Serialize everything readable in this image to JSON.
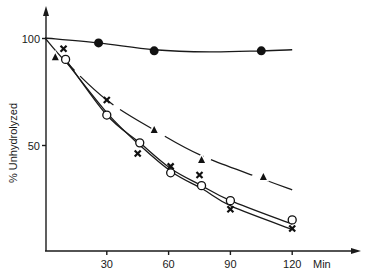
{
  "chart_data": {
    "type": "line",
    "title": "",
    "xlabel": "Min",
    "ylabel": "% Unhydrolyzed",
    "xlim": [
      0,
      140
    ],
    "ylim": [
      0,
      110
    ],
    "x_ticks": [
      30,
      60,
      90,
      120
    ],
    "y_ticks": [
      50,
      100
    ],
    "grid": false,
    "legend": "none",
    "series": [
      {
        "name": "filled-circle",
        "marker": "filled-circle",
        "line": "solid",
        "points": [
          [
            26,
            97.7
          ],
          [
            53,
            94
          ],
          [
            105,
            94
          ]
        ],
        "curve": [
          [
            0,
            100
          ],
          [
            26,
            97.7
          ],
          [
            53,
            94.5
          ],
          [
            80,
            93.5
          ],
          [
            105,
            94
          ],
          [
            120,
            94.5
          ]
        ]
      },
      {
        "name": "triangle",
        "marker": "filled-triangle",
        "line": "dashed-gaps",
        "points": [
          [
            5,
            91
          ],
          [
            53,
            57
          ],
          [
            76,
            43
          ],
          [
            106,
            35
          ]
        ],
        "curve": [
          [
            0,
            100
          ],
          [
            10,
            89
          ],
          [
            30,
            71
          ],
          [
            53,
            57
          ],
          [
            76,
            45
          ],
          [
            106,
            34
          ],
          [
            120,
            29
          ]
        ]
      },
      {
        "name": "cross",
        "marker": "x",
        "line": "solid",
        "points": [
          [
            9,
            95
          ],
          [
            30,
            71
          ],
          [
            45,
            46
          ],
          [
            61,
            40
          ],
          [
            75,
            36
          ],
          [
            90,
            20
          ],
          [
            120,
            11
          ]
        ],
        "curve": [
          [
            10,
            89
          ],
          [
            30,
            65
          ],
          [
            46,
            50
          ],
          [
            61,
            38
          ],
          [
            76,
            30
          ],
          [
            90,
            22
          ],
          [
            120,
            11
          ]
        ]
      },
      {
        "name": "open-circle",
        "marker": "open-circle",
        "line": "solid",
        "points": [
          [
            10,
            90
          ],
          [
            30,
            64
          ],
          [
            46,
            51
          ],
          [
            61,
            37
          ],
          [
            76,
            31
          ],
          [
            90,
            24
          ],
          [
            120,
            15
          ]
        ],
        "curve": [
          [
            10,
            90
          ],
          [
            30,
            64
          ],
          [
            46,
            51
          ],
          [
            61,
            39
          ],
          [
            76,
            31
          ],
          [
            90,
            24
          ],
          [
            120,
            13
          ]
        ]
      }
    ]
  }
}
